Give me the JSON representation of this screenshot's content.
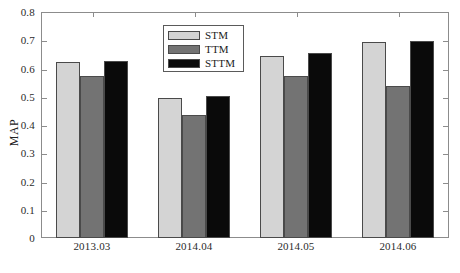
{
  "chart_data": {
    "type": "bar",
    "title": "",
    "xlabel": "",
    "ylabel": "MAP",
    "categories": [
      "2013.03",
      "2014.04",
      "2014.05",
      "2014.06"
    ],
    "series": [
      {
        "name": "STM",
        "color": "#d4d4d4",
        "values": [
          0.622,
          0.495,
          0.644,
          0.694
        ]
      },
      {
        "name": "TTM",
        "color": "#737373",
        "values": [
          0.574,
          0.437,
          0.572,
          0.538
        ]
      },
      {
        "name": "STTM",
        "color": "#0a0a0a",
        "values": [
          0.627,
          0.501,
          0.655,
          0.697
        ]
      }
    ],
    "ylim": [
      0,
      0.8
    ],
    "ytick_labels": [
      "0",
      "0.1",
      "0.2",
      "0.3",
      "0.4",
      "0.5",
      "0.6",
      "0.7",
      "0.8"
    ],
    "ytick_values": [
      0,
      0.1,
      0.2,
      0.3,
      0.4,
      0.5,
      0.6,
      0.7,
      0.8
    ],
    "grid": false,
    "legend_position": "top-center",
    "legend_entries": [
      "STM",
      "TTM",
      "STTM"
    ]
  }
}
